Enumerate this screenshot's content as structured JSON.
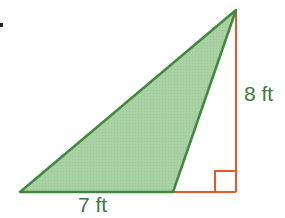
{
  "labels": {
    "base": "7 ft",
    "height": "8 ft"
  },
  "colors": {
    "fill": "#a9d1a4",
    "triangle_stroke": "#3f8a3f",
    "height_line": "#e8572a",
    "label_text": "#3d7a3d"
  }
}
